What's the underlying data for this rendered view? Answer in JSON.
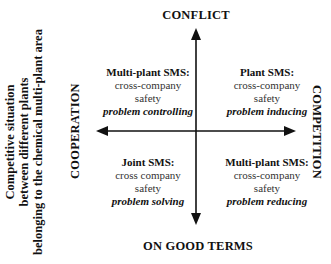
{
  "side_title": {
    "lines": [
      "Competitive situation",
      "between different plants",
      "belonging to the chemical multi-plant area"
    ]
  },
  "axes": {
    "top": "CONFLICT",
    "bottom": "ON GOOD TERMS",
    "left": "COOPERATION",
    "right": "COMPETITION"
  },
  "quadrants": {
    "top_left": {
      "title": "Multi-plant SMS:",
      "line1": "cross-company",
      "line2": "safety",
      "role": "problem controlling"
    },
    "top_right": {
      "title": "Plant SMS:",
      "line1": "cross-company",
      "line2": "safety",
      "role": "problem inducing"
    },
    "bottom_left": {
      "title": "Joint SMS:",
      "line1": "cross company",
      "line2": "safety",
      "role": "problem solving"
    },
    "bottom_right": {
      "title": "Multi-plant SMS:",
      "line1": "cross-company",
      "line2": "safety",
      "role": "problem reducing"
    }
  },
  "colors": {
    "ink": "#111111",
    "body_text": "#333333"
  }
}
